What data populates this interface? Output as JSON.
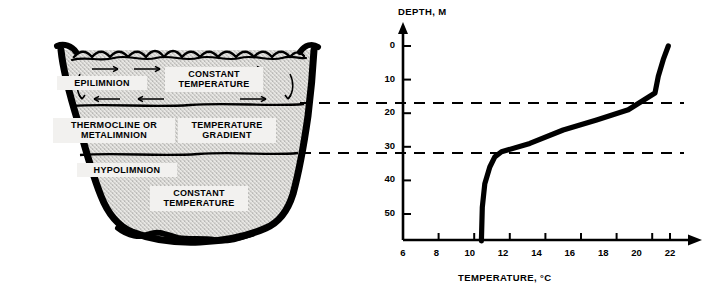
{
  "diagram": {
    "lake": {
      "layers": [
        {
          "name": "epilimnion",
          "label": "EPILIMNION",
          "note": "CONSTANT\nTEMPERATURE"
        },
        {
          "name": "thermocline",
          "label": "THERMOCLINE OR\nMETALIMNION",
          "note": "TEMPERATURE\nGRADIENT"
        },
        {
          "name": "hypolimnion",
          "label": "HYPOLIMNION",
          "note": "CONSTANT\nTEMPERATURE"
        }
      ],
      "labels": {
        "epilimnion": "EPILIMNION",
        "constant_temperature_top": "CONSTANT TEMPERATURE",
        "thermocline": "THERMOCLINE OR METALIMNION",
        "temperature_gradient": "TEMPERATURE GRADIENT",
        "hypolimnion": "HYPOLIMNION",
        "constant_temperature_bottom": "CONSTANT TEMPERATURE"
      }
    }
  },
  "chart_data": {
    "type": "line",
    "title": "DEPTH, M",
    "xlabel": "TEMPERATURE, °C",
    "ylabel": "DEPTH, M",
    "xlim": [
      6,
      22
    ],
    "ylim": [
      0,
      60
    ],
    "xticks": [
      6,
      8,
      10,
      12,
      14,
      16,
      18,
      20,
      22
    ],
    "yticks": [
      0,
      10,
      20,
      30,
      40,
      50
    ],
    "grid": false,
    "legend": null,
    "y_axis_inverted": true,
    "series": [
      {
        "name": "Temperature profile",
        "x": [
          21.9,
          21.6,
          21.3,
          21.1,
          19.5,
          17.6,
          15.6,
          13.6,
          11.9,
          11.5,
          11.2,
          10.9,
          10.75,
          10.7
        ],
        "y": [
          0,
          4,
          9,
          14,
          19,
          22,
          25,
          29,
          31.5,
          33,
          36,
          41,
          48,
          58
        ]
      }
    ],
    "annotations": [
      {
        "type": "hline",
        "name": "epilimnion-thermocline-boundary",
        "y": 17,
        "style": "dashed"
      },
      {
        "type": "hline",
        "name": "thermocline-hypolimnion-boundary",
        "y": 32,
        "style": "dashed"
      }
    ]
  }
}
